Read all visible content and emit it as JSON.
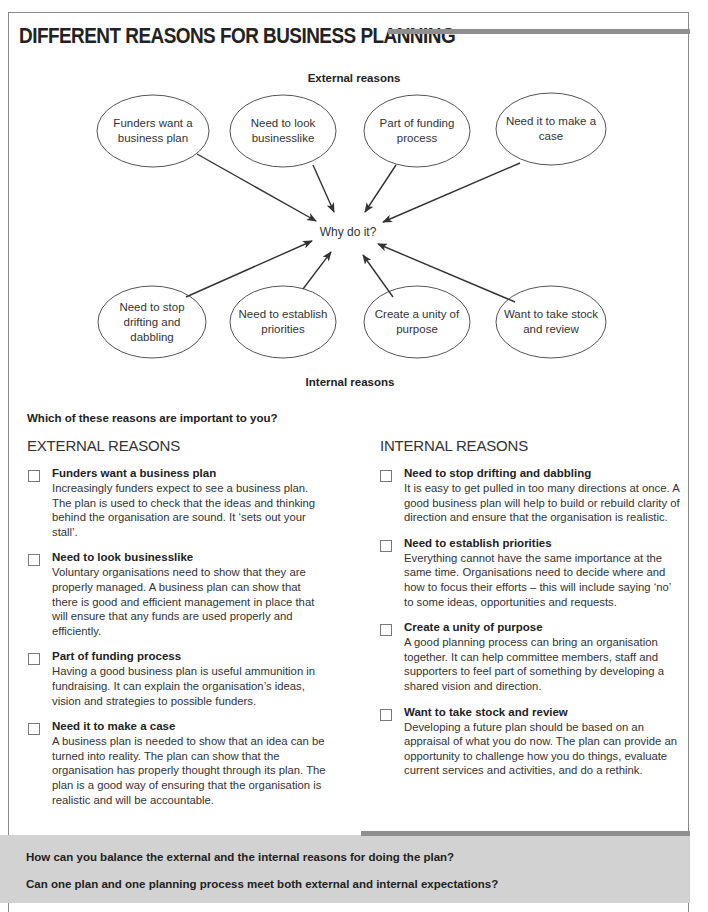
{
  "page": {
    "title": "DIFFERENT REASONS FOR BUSINESS PLANNING"
  },
  "diagram": {
    "external_label": "External reasons",
    "internal_label": "Internal reasons",
    "center": "Why do it?",
    "external_bubbles": [
      {
        "text": "Funders want a business plan"
      },
      {
        "text": "Need to look businesslike"
      },
      {
        "text": "Part of funding process"
      },
      {
        "text": "Need it to make a case"
      }
    ],
    "internal_bubbles": [
      {
        "text": "Need to stop drifting and dabbling"
      },
      {
        "text": "Need to establish priorities"
      },
      {
        "text": "Create a unity of purpose"
      },
      {
        "text": "Want to take stock and review"
      }
    ]
  },
  "checklist": {
    "prompt": "Which of these reasons are important to you?",
    "external": {
      "heading": "EXTERNAL REASONS",
      "items": [
        {
          "title": "Funders want a business plan",
          "body": "Increasingly funders expect to see a business plan. The plan is used to check that the ideas and thinking behind the organisation are sound. It ‘sets out your stall’."
        },
        {
          "title": "Need to look businesslike",
          "body": "Voluntary organisations need to show that they are properly managed. A business plan can show that there is good and efficient management in place that will ensure that any funds are used properly and efficiently."
        },
        {
          "title": "Part of funding process",
          "body": "Having a good business plan is useful ammunition in fundraising. It can explain the organisation’s ideas, vision and strategies to possible funders."
        },
        {
          "title": "Need it to make a case",
          "body": "A business plan is needed to show that an idea can be turned into reality. The plan can show that the organisation has properly thought through its plan. The plan is a good way of ensuring that the organisation is realistic and will be accountable."
        }
      ]
    },
    "internal": {
      "heading": "INTERNAL REASONS",
      "items": [
        {
          "title": "Need to stop drifting and dabbling",
          "body": "It is easy to get pulled in too many directions at once. A good business plan will help to build or rebuild clarity of direction and ensure that the organisation is realistic."
        },
        {
          "title": "Need to establish priorities",
          "body": "Everything cannot have the same importance at the same time. Organisations need to decide where and how to focus their efforts – this will include saying ‘no’ to some ideas, opportunities and requests."
        },
        {
          "title": "Create a unity of purpose",
          "body": "A good planning process can bring an organisation together. It can help committee members, staff and supporters to feel part of something by developing a shared vision and direction."
        },
        {
          "title": "Want to take stock and review",
          "body": "Developing a future plan should be based on an appraisal of what you do now. The plan can provide an opportunity to challenge how you do things, evaluate current services and activities, and do a rethink."
        }
      ]
    }
  },
  "questions": [
    "How can you balance the external and the internal reasons for doing the plan?",
    "Can one plan and one planning process meet both external and internal expectations?"
  ],
  "colors": {
    "accent_bar": "#8f8f8f",
    "band": "#d2d2d2",
    "text": "#222222"
  }
}
